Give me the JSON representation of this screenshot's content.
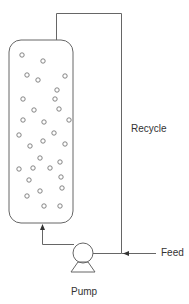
{
  "diagram": {
    "labels": {
      "recycle": "Recycle",
      "feed": "Feed",
      "pump": "Pump"
    },
    "colors": {
      "line": "#666666",
      "bubble": "#777777",
      "text": "#333333",
      "background": "#ffffff"
    },
    "vessel": {
      "x": 9,
      "y": 40,
      "width": 64,
      "height": 183,
      "radius": 12
    },
    "pump": {
      "cx": 83,
      "cy": 253,
      "r": 10
    },
    "bubbles": [
      [
        22,
        55
      ],
      [
        43,
        61
      ],
      [
        27,
        75
      ],
      [
        38,
        80
      ],
      [
        65,
        76
      ],
      [
        57,
        90
      ],
      [
        23,
        99
      ],
      [
        55,
        99
      ],
      [
        34,
        110
      ],
      [
        59,
        109
      ],
      [
        23,
        120
      ],
      [
        44,
        122
      ],
      [
        69,
        120
      ],
      [
        19,
        135
      ],
      [
        54,
        133
      ],
      [
        30,
        146
      ],
      [
        43,
        141
      ],
      [
        65,
        144
      ],
      [
        40,
        158
      ],
      [
        60,
        162
      ],
      [
        19,
        169
      ],
      [
        33,
        168
      ],
      [
        50,
        168
      ],
      [
        29,
        180
      ],
      [
        61,
        177
      ],
      [
        62,
        188
      ],
      [
        27,
        196
      ],
      [
        40,
        191
      ],
      [
        44,
        206
      ],
      [
        60,
        206
      ]
    ]
  }
}
